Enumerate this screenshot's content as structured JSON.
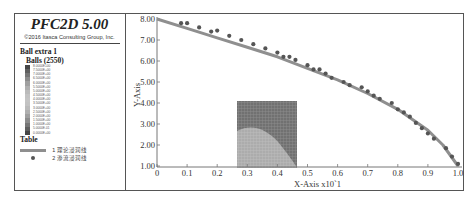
{
  "header": {
    "title": "PFC2D 5.00",
    "copyright": "©2016 Itasca Consulting Group, Inc."
  },
  "legend": {
    "section_title": "Ball extra 1",
    "subsection_title": "Balls (2550)",
    "colorbar_labels": [
      "8.0000E+00",
      "7.5000E+00",
      "7.0000E+00",
      "6.5000E+00",
      "6.0000E+00",
      "5.5000E+00",
      "5.0000E+00",
      "4.5000E+00",
      "4.0000E+00",
      "3.5000E+00",
      "3.0000E+00",
      "2.5000E+00",
      "2.0000E+00",
      "1.5000E+00",
      "1.0000E+00",
      "5.0000E-01",
      "0.0000E+00"
    ],
    "table_title": "Table",
    "entries": [
      {
        "index": "1",
        "label": "理论浸润线",
        "style": "line",
        "color": "#8f8f8f"
      },
      {
        "index": "2",
        "label": "渗流浸润线",
        "style": "dot",
        "color": "#555555"
      }
    ]
  },
  "chart_data": {
    "type": "line",
    "title": "PFC2D 5.00",
    "xlabel": "X-Axis x10^1",
    "ylabel": "Y-Axis",
    "xlim": [
      0,
      1.0
    ],
    "ylim": [
      1.0,
      8.0
    ],
    "x_ticks": [
      "0",
      "0.1",
      "0.2",
      "0.3",
      "0.4",
      "0.5",
      "0.6",
      "0.7",
      "0.8",
      "0.9",
      "1.0"
    ],
    "y_ticks": [
      "1.00",
      "2.00",
      "3.00",
      "4.00",
      "5.00",
      "6.00",
      "7.00",
      "8.00"
    ],
    "grid": false,
    "legend_position": "left panel",
    "series": [
      {
        "name": "1 理论浸润线",
        "style": "line",
        "x": [
          0,
          0.1,
          0.2,
          0.3,
          0.4,
          0.5,
          0.6,
          0.7,
          0.8,
          0.9,
          0.95,
          1.0
        ],
        "y": [
          8.0,
          7.55,
          7.1,
          6.65,
          6.2,
          5.65,
          5.1,
          4.45,
          3.7,
          2.7,
          2.0,
          1.0
        ]
      },
      {
        "name": "2 渗流浸润线",
        "style": "scatter",
        "x": [
          0.08,
          0.1,
          0.14,
          0.18,
          0.2,
          0.24,
          0.28,
          0.32,
          0.36,
          0.4,
          0.42,
          0.44,
          0.46,
          0.5,
          0.52,
          0.54,
          0.56,
          0.58,
          0.62,
          0.64,
          0.68,
          0.7,
          0.72,
          0.74,
          0.78,
          0.8,
          0.82,
          0.84,
          0.86,
          0.88,
          0.9,
          0.92,
          0.96,
          0.98,
          1.0
        ],
        "y": [
          7.8,
          7.8,
          7.6,
          7.4,
          7.45,
          7.2,
          7.0,
          6.8,
          6.6,
          6.4,
          6.2,
          6.2,
          6.05,
          5.8,
          5.6,
          5.6,
          5.4,
          5.2,
          5.0,
          4.85,
          4.75,
          4.55,
          4.35,
          4.2,
          4.0,
          3.7,
          3.55,
          3.35,
          3.05,
          2.8,
          2.55,
          2.3,
          1.85,
          1.45,
          1.1
        ]
      }
    ]
  },
  "colors": {
    "line": "#8f8f8f",
    "dots": "#555555",
    "frame": "#555555"
  }
}
